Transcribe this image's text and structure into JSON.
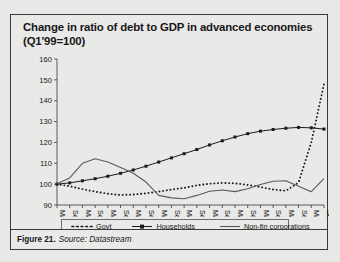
{
  "figure": {
    "title": "Change in ratio of debt to GDP in advanced economies (Q1'99=100)",
    "title_line1": "Change in ratio of debt to GDP in advanced economies",
    "title_line2": "(Q1'99=100)",
    "caption_figure": "Figure 21.",
    "caption_source": "Source: Datastream"
  },
  "legend": {
    "position": "bottom",
    "items": [
      {
        "label": "Govt",
        "style": "dotted",
        "color": "#1a1a1a"
      },
      {
        "label": "Households",
        "style": "line-with-markers",
        "color": "#1a1a1a"
      },
      {
        "label": "Non-fin corporations",
        "style": "solid",
        "color": "#5a5a5a"
      }
    ]
  },
  "chart_data": {
    "type": "line",
    "title": "Change in ratio of debt to GDP in advanced economies (Q1'99=100)",
    "xlabel": "",
    "ylabel": "",
    "ylim": [
      90,
      160
    ],
    "yticks": [
      90,
      100,
      110,
      120,
      130,
      140,
      150,
      160
    ],
    "grid": false,
    "legend_position": "bottom",
    "x": [
      "Mar-99",
      "Sep-99",
      "Mar-00",
      "Sep-00",
      "Mar-01",
      "Sep-01",
      "Mar-02",
      "Sep-02",
      "Mar-03",
      "Sep-03",
      "Mar-04",
      "Sep-04",
      "Mar-05",
      "Sep-05",
      "Mar-06",
      "Sep-06",
      "Mar-07",
      "Sep-07",
      "Mar-08",
      "Sep-08",
      "Mar-09",
      "Sep-09"
    ],
    "x_tick_labels": [
      "Mar-99",
      "Sep-99",
      "Mar-00",
      "Sep-00",
      "Mar-01",
      "Sep-01",
      "Mar-02",
      "Sep-02",
      "Mar-03",
      "Sep-03",
      "Mar-04",
      "Sep-04",
      "Mar-05",
      "Sep-05",
      "Mar-06",
      "Sep-06",
      "Mar-07",
      "Sep-07",
      "Mar-08",
      "Sep-08",
      "Mar-09",
      "Sep-09"
    ],
    "series": [
      {
        "name": "Govt",
        "style": "dotted",
        "values": [
          100.0,
          99.0,
          97.6,
          96.4,
          95.4,
          94.8,
          95.0,
          95.6,
          96.4,
          97.4,
          98.2,
          99.4,
          100.2,
          100.6,
          100.4,
          99.6,
          98.6,
          97.4,
          96.8,
          100.8,
          120.0,
          148.0
        ]
      },
      {
        "name": "Households",
        "style": "line-with-markers",
        "values": [
          100.0,
          100.6,
          101.6,
          102.6,
          103.8,
          105.2,
          106.8,
          108.6,
          110.6,
          112.6,
          114.6,
          116.6,
          118.8,
          120.8,
          122.6,
          124.2,
          125.4,
          126.2,
          126.8,
          127.2,
          127.0,
          126.4
        ]
      },
      {
        "name": "Non-fin corporations",
        "style": "solid",
        "values": [
          100.2,
          103.0,
          110.0,
          112.2,
          110.6,
          108.0,
          105.2,
          101.0,
          94.6,
          93.4,
          93.0,
          94.6,
          96.6,
          97.2,
          96.4,
          97.8,
          99.8,
          101.4,
          101.6,
          99.0,
          96.4,
          102.6
        ]
      }
    ]
  }
}
